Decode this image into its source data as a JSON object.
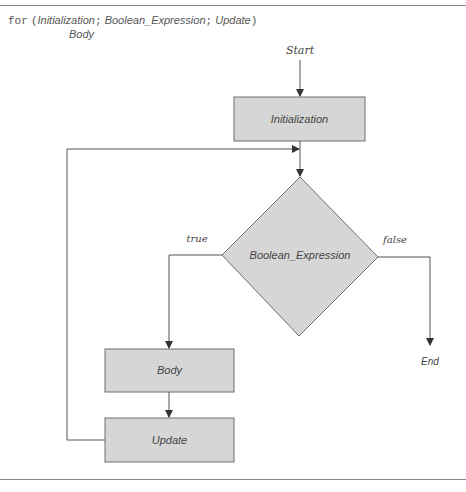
{
  "header": {
    "keyword": "for",
    "open_paren": "(",
    "initialization": "Initialization",
    "sep1": ";",
    "condition": "Boolean_Expression",
    "sep2": ";",
    "update": "Update",
    "close_paren": ")",
    "body": "Body"
  },
  "flowchart": {
    "start_label": "Start",
    "end_label": "End",
    "nodes": {
      "initialization": "Initialization",
      "condition": "Boolean_Expression",
      "body": "Body",
      "update": "Update"
    },
    "edges": {
      "true_label": "true",
      "false_label": "false"
    }
  },
  "colors": {
    "box_fill": "#d6d6d6",
    "box_stroke": "#6e6e6e",
    "line": "#555555",
    "rule": "#8a8a8a"
  }
}
